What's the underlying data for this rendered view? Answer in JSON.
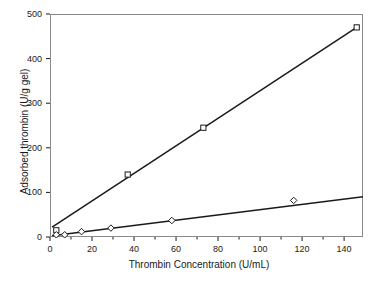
{
  "chart_data": {
    "type": "scatter",
    "title": "",
    "xlabel": "Thrombin Concentration (U/mL)",
    "ylabel": "Adsorbed thrombin (U/g gel)",
    "xlim": [
      0,
      149
    ],
    "ylim": [
      0,
      500
    ],
    "xticks": [
      0,
      20,
      40,
      60,
      80,
      100,
      120,
      140
    ],
    "yticks": [
      0,
      100,
      200,
      300,
      400,
      500
    ],
    "xtick_labels": [
      "0",
      "20",
      "40",
      "60",
      "80",
      "100",
      "120",
      "140"
    ],
    "ytick_labels": [
      "0",
      "100",
      "200",
      "300",
      "400",
      "500"
    ],
    "x_minor_ticks": [
      10,
      30,
      50,
      70,
      90,
      110,
      130
    ],
    "grid": false,
    "legend": "none",
    "series": [
      {
        "name": "series-squares",
        "marker": "square",
        "color": "#1a1a1a",
        "x": [
          3,
          37,
          73,
          146
        ],
        "y": [
          15,
          140,
          245,
          470
        ],
        "fit_line": {
          "x": [
            1,
            146
          ],
          "y": [
            22,
            470
          ]
        }
      },
      {
        "name": "series-diamonds",
        "marker": "diamond",
        "color": "#1a1a1a",
        "x": [
          3,
          7,
          15,
          29,
          58,
          116
        ],
        "y": [
          5,
          5,
          12,
          20,
          37,
          82
        ],
        "fit_line": {
          "x": [
            1,
            149
          ],
          "y": [
            3,
            90
          ]
        }
      }
    ]
  },
  "axes": {
    "frame_color": "#8a8a8a",
    "line_color": "#1a1a1a"
  }
}
